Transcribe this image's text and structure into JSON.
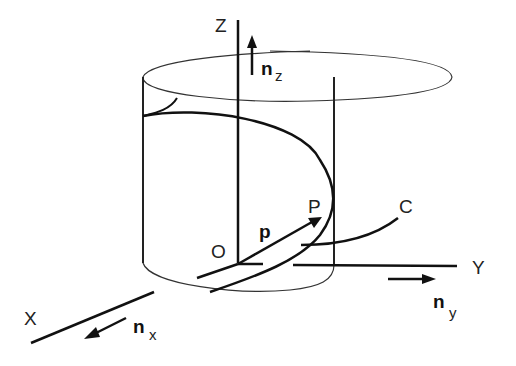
{
  "diagram": {
    "type": "3d-coordinate-figure",
    "axes": {
      "x": {
        "label": "X",
        "unit_vector": "n",
        "unit_sub": "x"
      },
      "y": {
        "label": "Y",
        "unit_vector": "n",
        "unit_sub": "y"
      },
      "z": {
        "label": "Z",
        "unit_vector": "n",
        "unit_sub": "z"
      }
    },
    "points": {
      "origin": "O",
      "point": "P"
    },
    "vector": "p",
    "curve": "C",
    "colors": {
      "line": "#111111",
      "background": "#ffffff"
    }
  }
}
